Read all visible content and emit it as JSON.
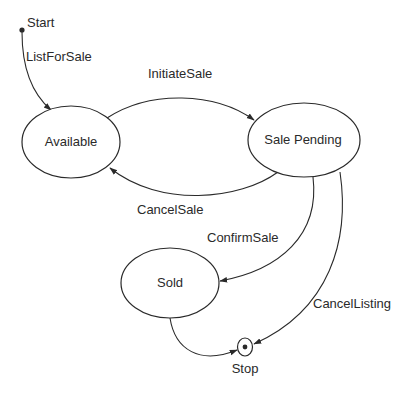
{
  "diagram": {
    "type": "state-machine",
    "initial": {
      "label": "Start"
    },
    "final": {
      "label": "Stop"
    },
    "states": [
      {
        "id": "available",
        "label": "Available"
      },
      {
        "id": "sale_pending",
        "label": "Sale Pending"
      },
      {
        "id": "sold",
        "label": "Sold"
      }
    ],
    "transitions": [
      {
        "from": "Start",
        "to": "Available",
        "label": "ListForSale"
      },
      {
        "from": "Available",
        "to": "Sale Pending",
        "label": "InitiateSale"
      },
      {
        "from": "Sale Pending",
        "to": "Available",
        "label": "CancelSale"
      },
      {
        "from": "Sale Pending",
        "to": "Sold",
        "label": "ConfirmSale"
      },
      {
        "from": "Sale Pending",
        "to": "Stop",
        "label": "CancelListing"
      },
      {
        "from": "Sold",
        "to": "Stop",
        "label": ""
      }
    ],
    "colors": {
      "stroke": "#2a2a2a",
      "fill": "#ffffff",
      "background": "#ffffff"
    }
  }
}
